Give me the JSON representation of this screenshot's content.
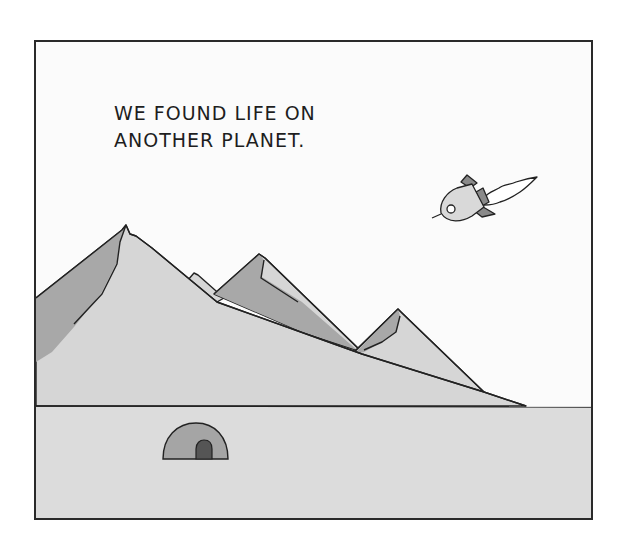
{
  "comic": {
    "caption_lines": [
      "WE FOUND LIFE ON",
      "ANOTHER PLANET."
    ],
    "elements": {
      "rocket": "rocket-icon",
      "exhaust": "exhaust-plume",
      "mountains": "mountain-range",
      "dome": "igloo-dome-habitat",
      "ground": "planet-surface"
    },
    "colors": {
      "sky": "#fbfbfb",
      "ground": "#dcdcdc",
      "mountain_light": "#d6d6d6",
      "mountain_shadow": "#a8a8a8",
      "rocket_body": "#d9d9d9",
      "rocket_fins": "#8a8a8a",
      "dome": "#a5a5a5",
      "door": "#555555",
      "outline": "#222222"
    }
  }
}
